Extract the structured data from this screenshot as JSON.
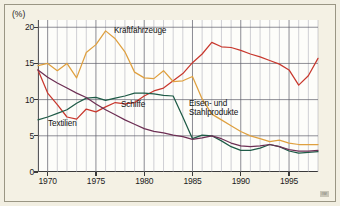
{
  "figure": {
    "unit_label": "(%)",
    "source_mark": "IW",
    "background_color": "#f4f1e4",
    "plot_background_color": "#fdfdfa"
  },
  "axes": {
    "y_ticks": [
      0,
      5,
      10,
      15,
      20
    ],
    "y_tick_labels": [
      "0",
      "5",
      "10",
      "15",
      "20"
    ],
    "ylim": [
      0,
      21
    ],
    "x_tick_labels": [
      "1970",
      "1975",
      "1980",
      "1985",
      "1990",
      "1995"
    ],
    "x_ticks": [
      1970,
      1975,
      1980,
      1985,
      1990,
      1995
    ],
    "xlim": [
      1969,
      1998
    ],
    "grid": "vertical yearly + horizontal at every 5 percent"
  },
  "annotations": [
    {
      "name": "kraftfahrzeuge-label",
      "text": "Kraftfahrzeuge",
      "left": 114,
      "top": 26
    },
    {
      "name": "eisen-stahl-label",
      "text": "Eisen- und",
      "left": 189,
      "top": 99
    },
    {
      "name": "eisen-stahl-label-2",
      "text": "Stahlprodukte",
      "left": 189,
      "top": 108
    },
    {
      "name": "schiffe-label",
      "text": "Schiffe",
      "left": 121,
      "top": 100
    },
    {
      "name": "textilien-label",
      "text": "Textilien",
      "left": 48,
      "top": 119
    }
  ],
  "chart_data": {
    "type": "line",
    "title": "",
    "subtitle": "",
    "xlabel": "",
    "ylabel": "(%)",
    "xlim": [
      1969,
      1998
    ],
    "ylim": [
      0,
      21
    ],
    "grid": true,
    "legend": "inline annotations next to each curve",
    "x": [
      1969,
      1970,
      1971,
      1972,
      1973,
      1974,
      1975,
      1976,
      1977,
      1978,
      1979,
      1980,
      1981,
      1982,
      1983,
      1984,
      1985,
      1986,
      1987,
      1988,
      1989,
      1990,
      1991,
      1992,
      1993,
      1994,
      1995,
      1996,
      1997,
      1998
    ],
    "series": [
      {
        "name": "Kraftfahrzeuge",
        "color": "#c8382e",
        "values": [
          14.1,
          10.9,
          9.3,
          7.6,
          7.3,
          8.7,
          8.3,
          9.0,
          9.6,
          9.4,
          9.6,
          10.5,
          11.2,
          11.6,
          12.6,
          13.6,
          15.1,
          16.3,
          17.9,
          17.3,
          17.2,
          16.8,
          16.3,
          15.9,
          15.4,
          14.9,
          14.1,
          12.0,
          13.3,
          15.7
        ]
      },
      {
        "name": "Eisen- und Stahlprodukte",
        "color": "#dfa03f",
        "values": [
          14.7,
          15.0,
          14.0,
          15.0,
          13.0,
          16.5,
          17.6,
          19.5,
          18.4,
          16.6,
          13.8,
          13.0,
          12.9,
          14.0,
          12.5,
          12.6,
          13.2,
          10.1,
          8.0,
          7.2,
          6.4,
          5.6,
          5.0,
          4.6,
          4.2,
          4.4,
          4.0,
          3.8,
          3.8,
          3.8
        ]
      },
      {
        "name": "Schiffe",
        "color": "#1f5b47",
        "values": [
          7.2,
          7.6,
          8.1,
          8.6,
          9.5,
          10.2,
          10.3,
          9.9,
          10.2,
          10.5,
          10.9,
          10.9,
          10.8,
          10.6,
          10.5,
          7.6,
          4.6,
          5.1,
          5.0,
          4.3,
          3.5,
          3.0,
          3.0,
          3.3,
          3.8,
          3.5,
          2.9,
          2.6,
          2.7,
          2.8
        ]
      },
      {
        "name": "Textilien",
        "color": "#6d2f54",
        "values": [
          14.1,
          13.1,
          12.3,
          11.6,
          10.9,
          10.3,
          9.4,
          8.6,
          7.9,
          7.2,
          6.6,
          6.0,
          5.6,
          5.4,
          5.1,
          4.9,
          4.5,
          4.7,
          5.0,
          4.6,
          4.0,
          3.6,
          3.5,
          3.6,
          3.8,
          3.5,
          3.1,
          2.9,
          2.9,
          3.0
        ]
      }
    ]
  }
}
